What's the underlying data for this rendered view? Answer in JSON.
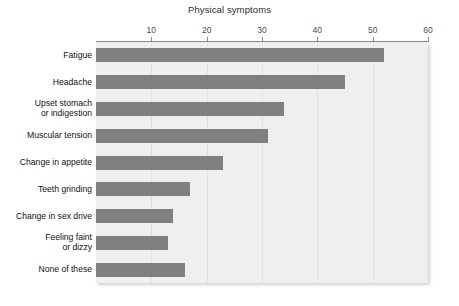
{
  "chart_data": {
    "type": "bar",
    "orientation": "horizontal",
    "title": "Physical symptoms",
    "xlabel": "",
    "ylabel": "",
    "xlim": [
      0,
      60
    ],
    "ticks": [
      10,
      20,
      30,
      40,
      50,
      60
    ],
    "tick_labels": [
      "10",
      "20",
      "30",
      "40",
      "50",
      "60"
    ],
    "axis_position": "top",
    "grid": true,
    "grid_axis": "x",
    "legend": false,
    "categories": [
      "Fatigue",
      "Headache",
      "Upset stomach\nor indigestion",
      "Muscular tension",
      "Change in appetite",
      "Teeth grinding",
      "Change in sex drive",
      "Feeling faint\nor dizzy",
      "None of these"
    ],
    "values": [
      52,
      45,
      34,
      31,
      23,
      17,
      14,
      13,
      16
    ],
    "bar_color": "#808080",
    "plot_background": "#efefef",
    "page_background": "#ffffff"
  }
}
